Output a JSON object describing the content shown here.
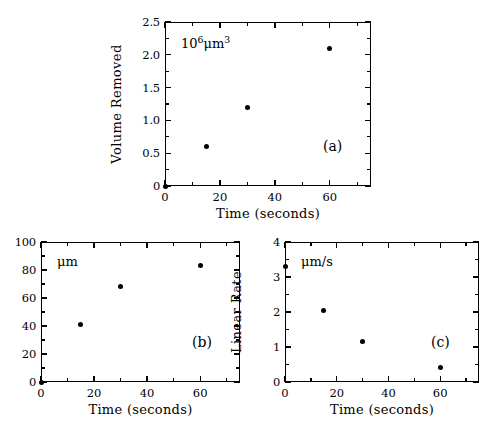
{
  "figure": {
    "background": "#ffffff",
    "marker_color": "#000000",
    "axis_color": "#000000"
  },
  "chart_data": [
    {
      "type": "scatter",
      "panel": "a",
      "panel_label": "(a)",
      "title": "",
      "xlabel": "Time (seconds)",
      "ylabel": "Volume Removed",
      "units_annotation": "10⁶μm³",
      "units_base": "10",
      "units_exp": "6",
      "units_rest": "μm",
      "units_rest_exp": "3",
      "xlim": [
        0,
        75
      ],
      "ylim": [
        0,
        2.5
      ],
      "xticks": [
        0,
        20,
        40,
        60
      ],
      "xticklabels": [
        "0",
        "20",
        "40",
        "60"
      ],
      "yticks": [
        0,
        0.5,
        1.0,
        1.5,
        2.0,
        2.5
      ],
      "yticklabels": [
        "0",
        "0.5",
        "1.0",
        "1.5",
        "2.0",
        "2.5"
      ],
      "x": [
        0,
        15,
        30,
        60
      ],
      "y": [
        0.0,
        0.6,
        1.2,
        2.1
      ],
      "grid": false,
      "legend": "none"
    },
    {
      "type": "scatter",
      "panel": "b",
      "panel_label": "(b)",
      "title": "",
      "xlabel": "Time (seconds)",
      "ylabel": "Depth",
      "units_annotation": "μm",
      "xlim": [
        0,
        75
      ],
      "ylim": [
        0,
        100
      ],
      "xticks": [
        0,
        20,
        40,
        60
      ],
      "xticklabels": [
        "0",
        "20",
        "40",
        "60"
      ],
      "yticks": [
        0,
        20,
        40,
        60,
        80,
        100
      ],
      "yticklabels": [
        "0",
        "20",
        "40",
        "60",
        "80",
        "100"
      ],
      "x": [
        0,
        15,
        30,
        60
      ],
      "y": [
        0,
        41,
        68,
        83
      ],
      "grid": false,
      "legend": "none"
    },
    {
      "type": "scatter",
      "panel": "c",
      "panel_label": "(c)",
      "title": "",
      "xlabel": "Time (seconds)",
      "ylabel": "Linear Rate",
      "units_annotation": "μm/s",
      "xlim": [
        0,
        75
      ],
      "ylim": [
        0,
        4
      ],
      "xticks": [
        0,
        20,
        40,
        60
      ],
      "xticklabels": [
        "0",
        "20",
        "40",
        "60"
      ],
      "yticks": [
        0,
        1,
        2,
        3,
        4
      ],
      "yticklabels": [
        "0",
        "1",
        "2",
        "3",
        "4"
      ],
      "x": [
        0,
        15,
        30,
        60
      ],
      "y": [
        3.3,
        2.05,
        1.15,
        0.42
      ],
      "grid": false,
      "legend": "none"
    }
  ]
}
